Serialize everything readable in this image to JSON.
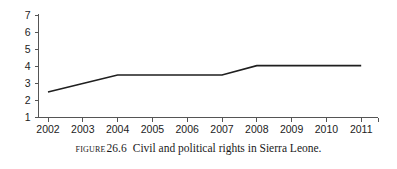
{
  "caption": {
    "prefix": "Figure",
    "number": "26.6",
    "text": "Civil and political rights in Sierra Leone."
  },
  "chart_data": {
    "type": "line",
    "title": "Civil and political rights in Sierra Leone.",
    "xlabel": "",
    "ylabel": "",
    "categories": [
      "2002",
      "2003",
      "2004",
      "2005",
      "2006",
      "2007",
      "2008",
      "2009",
      "2010",
      "2011"
    ],
    "x": [
      2002,
      2003,
      2004,
      2005,
      2006,
      2007,
      2008,
      2009,
      2010,
      2011
    ],
    "values": [
      2.5,
      3.0,
      3.5,
      3.5,
      3.5,
      3.5,
      4.05,
      4.05,
      4.05,
      4.05
    ],
    "series": [
      {
        "name": "Civil and political rights",
        "values": [
          2.5,
          3.0,
          3.5,
          3.5,
          3.5,
          3.5,
          4.05,
          4.05,
          4.05,
          4.05
        ]
      }
    ],
    "ylim": [
      1,
      7
    ],
    "yticks": [
      1,
      2,
      3,
      4,
      5,
      6,
      7
    ],
    "ytick_labels": [
      "1",
      "2",
      "3",
      "4",
      "5",
      "6",
      "7"
    ],
    "xtick_labels": [
      "2002",
      "2003",
      "2004",
      "2005",
      "2006",
      "2007",
      "2008",
      "2009",
      "2010",
      "2011"
    ],
    "grid": false,
    "legend": false,
    "line_color": "#1f1f1f",
    "axis_color": "#555555",
    "background_color": "#ffffff"
  }
}
